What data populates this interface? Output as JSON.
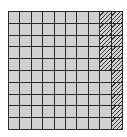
{
  "figure": {
    "rows": 10,
    "cols": 10,
    "total_cells": 100,
    "hatched_count": 15,
    "hatched_cells": [
      [
        0,
        8
      ],
      [
        1,
        8
      ],
      [
        2,
        8
      ],
      [
        3,
        8
      ],
      [
        4,
        8
      ],
      [
        0,
        9
      ],
      [
        1,
        9
      ],
      [
        2,
        9
      ],
      [
        3,
        9
      ],
      [
        4,
        9
      ],
      [
        5,
        9
      ],
      [
        6,
        9
      ],
      [
        7,
        9
      ],
      [
        8,
        9
      ],
      [
        9,
        9
      ]
    ],
    "colors": {
      "cell": "#d0d0d0",
      "line": "#2a2a2a",
      "hatch": "#3a3a3a"
    }
  }
}
